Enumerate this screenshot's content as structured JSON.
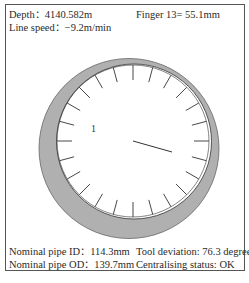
{
  "header": {
    "depth": "Depth：4140.582m",
    "line_speed": "Line speed：−9.2m/min",
    "finger": "Finger 13= 55.1mm"
  },
  "footer": {
    "nominal_id": "Nominal pipe ID：114.3mm",
    "nominal_od": "Nominal pipe OD：139.7mm",
    "tool_deviation": "Tool deviation: 76.3 degrees",
    "centralising_status": "Centralising status: OK"
  },
  "diagram": {
    "finger_marker_label": "1",
    "tick_count": 24,
    "colors": {
      "pipe_wall": "#b0b0b0",
      "line": "#333333",
      "bore": "#ffffff"
    },
    "outer_circle": {
      "cx": 129,
      "cy": 148.5,
      "r": 90
    },
    "inner_circle": {
      "cx": 134,
      "cy": 141.5,
      "r": 77.5
    },
    "needle": {
      "x1": 133,
      "y1": 141,
      "x2": 172,
      "y2": 152
    }
  }
}
